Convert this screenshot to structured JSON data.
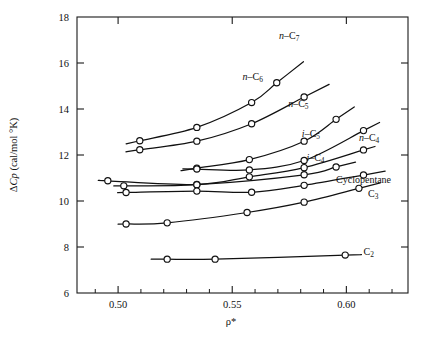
{
  "chart_data": {
    "type": "line",
    "title": "",
    "xlabel": "ρ*",
    "ylabel": "ΔCp (cal/mol °K)",
    "xlim": [
      0.482,
      0.627
    ],
    "ylim": [
      6,
      18
    ],
    "grid": false,
    "legend": "inline-curve-labels",
    "x_ticks": [
      0.5,
      0.55,
      0.6
    ],
    "x_tick_labels": [
      "0.50",
      "0.55",
      "0.60"
    ],
    "x_minor_ticks": [
      0.49,
      0.51,
      0.52,
      0.53,
      0.54,
      0.56,
      0.57,
      0.58,
      0.59,
      0.61,
      0.62
    ],
    "y_ticks": [
      6,
      8,
      10,
      12,
      14,
      16,
      18
    ],
    "y_tick_labels": [
      "6",
      "8",
      "10",
      "12",
      "14",
      "16",
      "18"
    ],
    "marker": "open-circle",
    "series": [
      {
        "name": "n-C7",
        "label_html": "<tspan class=\"it\">n</tspan>–C<tspan class=\"sub\" dy=\"2.2\">7</tspan>",
        "label_x": 0.5705,
        "label_y": 17.05,
        "x": [
          0.5095,
          0.5345,
          0.5585,
          0.5695
        ],
        "y": [
          12.62,
          13.2,
          14.28,
          15.14
        ]
      },
      {
        "name": "n-C6",
        "label_html": "<tspan class=\"it\">n</tspan>–C<tspan class=\"sub\" dy=\"2.2\">6</tspan>",
        "label_x": 0.5545,
        "label_y": 15.25,
        "x": [
          0.5095,
          0.5345,
          0.5585,
          0.5815
        ],
        "y": [
          12.23,
          12.6,
          13.36,
          14.52
        ]
      },
      {
        "name": "n-C5",
        "label_html": "<tspan class=\"it\">n</tspan>–C<tspan class=\"sub\" dy=\"2.2\">5</tspan>",
        "label_x": 0.5745,
        "label_y": 14.08,
        "x": [
          0.5345,
          0.5575,
          0.5815,
          0.5955
        ],
        "y": [
          11.43,
          11.8,
          12.6,
          13.55
        ]
      },
      {
        "name": "i-C5",
        "label_html": "<tspan class=\"it\">i</tspan>–C<tspan class=\"sub\" dy=\"2.2\">5</tspan>",
        "label_x": 0.5805,
        "label_y": 12.77,
        "x": [
          0.5345,
          0.5575,
          0.5815,
          0.6075
        ],
        "y": [
          11.39,
          11.35,
          11.76,
          13.06
        ]
      },
      {
        "name": "n-C4",
        "label_html": "<tspan class=\"it\">n</tspan>–C<tspan class=\"sub\" dy=\"2.2\">4</tspan>",
        "label_x": 0.6055,
        "label_y": 12.62,
        "x": [
          0.4955,
          0.5345,
          0.5575,
          0.5815,
          0.6075
        ],
        "y": [
          10.88,
          10.72,
          11.05,
          11.45,
          12.22
        ]
      },
      {
        "name": "i-C4",
        "label_html": "<tspan class=\"it\">i</tspan>–C<tspan class=\"sub\" dy=\"2.2\">4</tspan>",
        "label_x": 0.5825,
        "label_y": 11.74,
        "x": [
          0.5025,
          0.5345,
          0.5815,
          0.5955
        ],
        "y": [
          10.66,
          10.71,
          11.14,
          11.48
        ]
      },
      {
        "name": "Cyclopentane",
        "label_html": "Cyclopentane",
        "label_x": 0.5955,
        "label_y": 10.77,
        "x": [
          0.5035,
          0.5345,
          0.5585,
          0.5815,
          0.6075
        ],
        "y": [
          10.37,
          10.43,
          10.38,
          10.68,
          11.13
        ]
      },
      {
        "name": "C3",
        "label_html": "C<tspan class=\"sub\" dy=\"2.2\">3</tspan>",
        "label_x": 0.6095,
        "label_y": 10.18,
        "x": [
          0.5035,
          0.5215,
          0.5565,
          0.5815,
          0.6055
        ],
        "y": [
          9.0,
          9.05,
          9.5,
          9.95,
          10.55
        ]
      },
      {
        "name": "C2",
        "label_html": "C<tspan class=\"sub\" dy=\"2.2\">2</tspan>",
        "label_x": 0.6075,
        "label_y": 7.65,
        "x": [
          0.5215,
          0.5425,
          0.5995
        ],
        "y": [
          7.47,
          7.47,
          7.65
        ]
      }
    ]
  },
  "axes": {
    "x_title": "ρ*",
    "y_title_prefix": "Δ",
    "y_title_italic": "Cp",
    "y_title_rest": " (cal/mol °K)"
  }
}
